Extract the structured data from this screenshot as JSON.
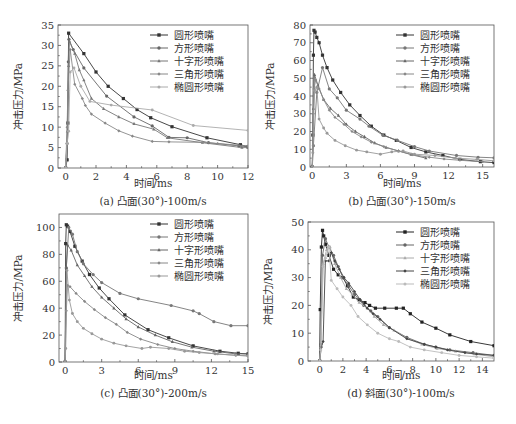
{
  "legend_labels": [
    "圆形喷嘴",
    "方形喷嘴",
    "十字形喷嘴",
    "三角形喷嘴",
    "椭圆形喷嘴"
  ],
  "chart_data": [
    {
      "id": "a",
      "type": "line",
      "caption": "(a) 凸面(30°)-100m/s",
      "xlabel": "时间/ms",
      "ylabel": "冲击压力/MPa",
      "xlim": [
        -0.5,
        12
      ],
      "ylim": [
        0,
        35
      ],
      "xticks": [
        0,
        2,
        4,
        6,
        8,
        10,
        12
      ],
      "yticks": [
        0,
        5,
        10,
        15,
        20,
        25,
        30,
        35
      ],
      "grid": false,
      "legend_position": "upper right",
      "series": [
        {
          "name": "圆形喷嘴",
          "color": "#333333",
          "marker": "square",
          "x": [
            0.0,
            0.1,
            0.15,
            0.2,
            1.2,
            2.0,
            2.8,
            3.8,
            4.7,
            5.6,
            7.0,
            9.3,
            11.5,
            12
          ],
          "y": [
            0,
            2,
            11,
            33,
            28,
            23.5,
            20,
            17,
            14.3,
            12.3,
            10.1,
            7.4,
            5.7,
            5.2
          ]
        },
        {
          "name": "方形喷嘴",
          "color": "#666666",
          "marker": "circle",
          "x": [
            0.0,
            0.1,
            0.18,
            0.22,
            0.5,
            1.2,
            2.7,
            4.5,
            5.7,
            6.8,
            8.0,
            9.4,
            11.4,
            12
          ],
          "y": [
            0,
            6,
            26,
            31.5,
            29,
            24.5,
            17.6,
            12.5,
            10.3,
            7.5,
            7.4,
            6.2,
            5.4,
            5.2
          ]
        },
        {
          "name": "十字形喷嘴",
          "color": "#777777",
          "marker": "triangle",
          "x": [
            0.0,
            0.12,
            0.2,
            0.25,
            0.6,
            0.9,
            1.2,
            1.7,
            2.5,
            3.5,
            4.5,
            5.8,
            6.7,
            9.0,
            11.6,
            12
          ],
          "y": [
            0,
            9,
            25,
            31,
            28,
            24,
            21.5,
            17,
            14.5,
            12.5,
            10.8,
            9.5,
            7.4,
            6.2,
            5.0,
            5.0
          ]
        },
        {
          "name": "三角形喷嘴",
          "color": "#888888",
          "marker": "diamond",
          "x": [
            0.0,
            0.1,
            0.15,
            0.3,
            0.6,
            1.1,
            1.3,
            1.7,
            2.6,
            3.5,
            4.4,
            5.7,
            6.8,
            9.0,
            10.0,
            12
          ],
          "y": [
            0,
            10,
            19,
            29,
            20.5,
            17,
            15.3,
            13.2,
            11,
            9.1,
            7.8,
            6.5,
            6.4,
            6.3,
            6.0,
            5.4
          ]
        },
        {
          "name": "椭圆形喷嘴",
          "color": "#aaaaaa",
          "marker": "star",
          "x": [
            0.0,
            0.1,
            0.2,
            0.3,
            0.55,
            1.0,
            1.6,
            3.0,
            5.7,
            8.4,
            12
          ],
          "y": [
            0,
            6,
            9,
            23.5,
            24.5,
            20,
            16.3,
            15.4,
            14.2,
            10.4,
            9.2
          ]
        }
      ]
    },
    {
      "id": "b",
      "type": "line",
      "caption": "(b) 凸面(30°)-150m/s",
      "xlabel": "时间/ms",
      "ylabel": "冲击压力/MPa",
      "xlim": [
        -0.2,
        16
      ],
      "ylim": [
        0,
        80
      ],
      "xticks": [
        0,
        3,
        6,
        9,
        12,
        15
      ],
      "yticks": [
        0,
        10,
        20,
        30,
        40,
        50,
        60,
        70,
        80
      ],
      "grid": false,
      "legend_position": "upper right",
      "series": [
        {
          "name": "圆形喷嘴",
          "color": "#333333",
          "marker": "square",
          "x": [
            0.0,
            0.05,
            0.1,
            0.15,
            0.25,
            0.4,
            0.6,
            0.9,
            1.3,
            1.8,
            2.5,
            3.3,
            4.2,
            5.2,
            6.3,
            7.4,
            8.7,
            10.0,
            11.5,
            13.0,
            14.8,
            16
          ],
          "y": [
            0,
            18,
            63,
            77,
            76,
            73,
            70,
            63,
            56,
            49,
            42,
            35,
            29,
            23,
            18,
            15,
            11,
            8.5,
            6.5,
            4.3,
            3.0,
            2.5
          ]
        },
        {
          "name": "方形喷嘴",
          "color": "#777777",
          "marker": "circle",
          "x": [
            0.0,
            0.1,
            0.4,
            0.9,
            1.5,
            2.2,
            3.0,
            4.2,
            5.0,
            6.2,
            7.5,
            9.0,
            10.3,
            12.7,
            14.6,
            16
          ],
          "y": [
            0,
            12,
            42,
            56,
            44,
            39,
            32,
            27,
            23,
            18,
            15,
            11.5,
            9,
            6.5,
            5.5,
            5.2
          ]
        },
        {
          "name": "十字形喷嘴",
          "color": "#666666",
          "marker": "triangle",
          "x": [
            0.0,
            0.1,
            0.2,
            0.5,
            1.0,
            1.6,
            2.3,
            3.0,
            3.8,
            4.6,
            5.5,
            6.5,
            7.6,
            8.7,
            10.0
          ],
          "y": [
            0,
            33,
            52,
            46,
            38,
            33,
            29,
            24,
            20,
            17,
            13.5,
            11,
            9,
            7,
            5
          ]
        },
        {
          "name": "三角形喷嘴",
          "color": "#888888",
          "marker": "diamond",
          "x": [
            0.0,
            0.1,
            0.15,
            0.3,
            0.6,
            1.0,
            1.5,
            2.0,
            2.8,
            3.5,
            4.3,
            5.2,
            6.3,
            7.6,
            8.8,
            10.3,
            11.6,
            13.0,
            15
          ],
          "y": [
            0,
            30,
            44,
            49,
            44,
            38,
            32,
            28,
            24,
            20,
            17,
            14,
            11.5,
            9,
            7,
            5.5,
            4.5,
            3.8,
            3
          ]
        },
        {
          "name": "椭圆形喷嘴",
          "color": "#999999",
          "marker": "star",
          "x": [
            0.0,
            0.05,
            0.2,
            0.4,
            0.6,
            1.0,
            1.3,
            2.0,
            2.9,
            3.9,
            4.8,
            6.0,
            7.0,
            8.0,
            9.0,
            10.8,
            12.6,
            14.5,
            16
          ],
          "y": [
            0,
            8,
            43,
            45,
            27,
            22,
            19,
            15,
            12,
            9.5,
            8.5,
            7.2,
            8.5,
            9,
            7.2,
            6.5,
            5.0,
            4.3,
            3.5
          ]
        }
      ]
    },
    {
      "id": "c",
      "type": "line",
      "caption": "(c) 凸面(30°)-200m/s",
      "xlabel": "时间/ms",
      "ylabel": "冲击压力/MPa",
      "xlim": [
        -0.5,
        15
      ],
      "ylim": [
        0,
        110
      ],
      "xticks": [
        0,
        3,
        6,
        9,
        12,
        15
      ],
      "yticks": [
        0,
        20,
        40,
        60,
        80,
        100
      ],
      "grid": false,
      "legend_position": "upper right",
      "series": [
        {
          "name": "圆形喷嘴",
          "color": "#333333",
          "marker": "square",
          "x": [
            0.0,
            0.05,
            0.1,
            0.2,
            0.4,
            0.8,
            1.4,
            2.0,
            2.8,
            3.6,
            4.9,
            6.8,
            8.5,
            10.5,
            12.7,
            14.2,
            15
          ],
          "y": [
            0,
            88,
            102,
            101,
            97,
            86,
            75,
            65,
            55,
            47,
            35,
            24,
            18,
            12,
            8,
            6.5,
            6
          ]
        },
        {
          "name": "方形喷嘴",
          "color": "#777777",
          "marker": "circle",
          "x": [
            0.0,
            0.1,
            0.3,
            0.6,
            1.0,
            1.5,
            2.3,
            3.0,
            4.5,
            6.0,
            8.7,
            10.5,
            11.0,
            12.2,
            13.6,
            15
          ],
          "y": [
            0,
            70,
            100,
            95,
            82,
            73,
            65,
            59,
            51,
            47,
            42,
            38,
            36,
            30,
            27,
            27
          ]
        },
        {
          "name": "十字形喷嘴",
          "color": "#666666",
          "marker": "triangle",
          "x": [
            0.0,
            0.1,
            0.2,
            0.5,
            1.0,
            1.6,
            2.2,
            3.0,
            4.0,
            5.0,
            6.0,
            7.4,
            8.8,
            10.4,
            12.2,
            14,
            15
          ],
          "y": [
            0,
            70,
            87,
            83,
            72,
            64,
            56,
            48,
            40,
            32,
            26,
            20,
            15,
            11,
            8,
            6,
            6
          ]
        },
        {
          "name": "三角形喷嘴",
          "color": "#888888",
          "marker": "diamond",
          "x": [
            0.0,
            0.1,
            0.2,
            0.4,
            0.9,
            1.6,
            2.4,
            3.3,
            4.2,
            5.1,
            6.2,
            7.6,
            9.0,
            10.5,
            12.3,
            14,
            15
          ],
          "y": [
            0,
            38,
            57,
            56,
            51,
            45,
            39,
            33,
            28,
            22,
            17,
            13,
            10,
            8,
            6,
            5,
            4.5
          ]
        },
        {
          "name": "椭圆形喷嘴",
          "color": "#999999",
          "marker": "star",
          "x": [
            0.0,
            0.05,
            0.15,
            0.35,
            0.6,
            1.0,
            1.5,
            2.2,
            3.0,
            4.0,
            5.0,
            6.3,
            7.0,
            8.5,
            9.8,
            11.0,
            12.5,
            14,
            15
          ],
          "y": [
            0,
            10,
            68,
            46,
            36,
            30,
            25,
            21,
            17,
            14,
            12,
            10,
            11,
            10,
            8,
            7,
            6,
            5,
            4.5
          ]
        }
      ]
    },
    {
      "id": "d",
      "type": "line",
      "caption": "(d) 斜面(30°)-100m/s",
      "xlabel": "时间/ms",
      "ylabel": "冲击压力/MPa",
      "xlim": [
        -1,
        15
      ],
      "ylim": [
        0,
        50
      ],
      "xticks": [
        0,
        2,
        4,
        6,
        8,
        10,
        12,
        14
      ],
      "yticks": [
        0,
        10,
        20,
        30,
        40,
        50
      ],
      "grid": false,
      "legend_position": "upper right",
      "series": [
        {
          "name": "圆形喷嘴",
          "color": "#222222",
          "marker": "square",
          "x": [
            0.0,
            0.05,
            0.15,
            0.25,
            0.35,
            0.5,
            0.8,
            1.2,
            1.6,
            2.0,
            2.4,
            2.9,
            3.4,
            3.9,
            4.3,
            4.8,
            5.6,
            6.6,
            7.2,
            7.8,
            8.8,
            10.0,
            11.2,
            13.0,
            15
          ],
          "y": [
            0,
            18.5,
            41,
            47,
            45,
            42,
            38,
            33,
            31,
            30,
            27,
            23,
            22,
            21,
            20,
            19,
            19,
            19,
            19,
            17,
            14,
            11.8,
            9.4,
            7,
            5.5
          ]
        },
        {
          "name": "方形喷嘴",
          "color": "#666666",
          "marker": "circle",
          "x": [
            0.0,
            0.1,
            0.25,
            0.5,
            0.8,
            1.2,
            1.6,
            2.0,
            2.5,
            3.0,
            3.8,
            4.4,
            5.0,
            6.0,
            7.5,
            9.0,
            10.0,
            11.2,
            13.2,
            15
          ],
          "y": [
            0,
            6,
            38,
            44,
            41,
            38,
            34,
            30,
            27,
            24,
            20,
            18,
            16,
            12,
            8.5,
            6,
            5,
            4,
            3,
            2
          ]
        },
        {
          "name": "十字形喷嘴",
          "color": "#aaaaaa",
          "marker": "triangle",
          "x": [
            0.0,
            0.1,
            0.3,
            0.6,
            0.9,
            1.3,
            1.8,
            2.3,
            2.8,
            3.4,
            4.1,
            4.7,
            5.5,
            6.4,
            7.6,
            8.8,
            10.1,
            11.7,
            13.3,
            15
          ],
          "y": [
            0,
            5,
            35,
            40,
            41,
            35,
            30,
            26,
            24,
            21,
            19,
            16,
            13,
            11,
            8,
            6,
            4.5,
            3.5,
            2.5,
            1.5
          ]
        },
        {
          "name": "三角形喷嘴",
          "color": "#444444",
          "marker": "diamond",
          "x": [
            0.0,
            0.15,
            0.3,
            0.5,
            0.8,
            1.0,
            1.3,
            1.7,
            2.1,
            2.5,
            3.0,
            3.5,
            4.1,
            4.6,
            5.2,
            6.0,
            7.5,
            9.0,
            10.0,
            11.0,
            12.5,
            13.5,
            15
          ],
          "y": [
            0,
            5,
            7,
            36,
            36,
            39,
            36,
            33,
            30,
            28,
            25,
            22,
            19,
            17,
            15,
            12,
            8,
            6,
            5,
            4,
            3,
            2.5,
            2
          ]
        },
        {
          "name": "椭圆形喷嘴",
          "color": "#bbbbbb",
          "marker": "star",
          "x": [
            0.0,
            0.1,
            0.3,
            0.5,
            0.8,
            1.0,
            1.5,
            2.0,
            2.7,
            3.3,
            4.1,
            5.0,
            6.0,
            6.8,
            7.8,
            9.0,
            10.5,
            12.0,
            13.5,
            15
          ],
          "y": [
            0,
            4,
            34,
            37,
            41,
            29,
            26,
            23,
            20,
            16,
            13,
            10,
            8,
            7,
            5,
            4,
            3,
            2,
            1.5,
            1
          ]
        }
      ]
    }
  ]
}
